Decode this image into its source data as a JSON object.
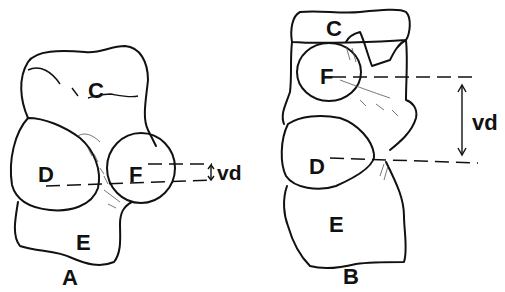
{
  "figure": {
    "panels": [
      {
        "id": "A",
        "caption": "A",
        "labels": {
          "c": "C",
          "d": "D",
          "e": "E",
          "f": "F"
        },
        "measure": "vd"
      },
      {
        "id": "B",
        "caption": "B",
        "labels": {
          "c": "C",
          "d": "D",
          "e": "E",
          "f": "F"
        },
        "measure": "vd"
      }
    ]
  }
}
